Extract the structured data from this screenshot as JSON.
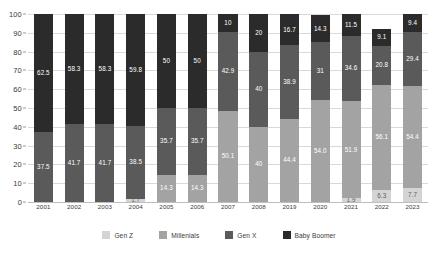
{
  "chart_data": {
    "type": "bar",
    "stacked": true,
    "title": "",
    "subtitle": "",
    "xlabel": "",
    "ylabel": "",
    "ylim": [
      0,
      100
    ],
    "yticks": [
      0,
      10,
      20,
      30,
      40,
      50,
      60,
      70,
      80,
      90,
      100
    ],
    "ytick_labels": [
      "0",
      "10",
      "20",
      "30",
      "40",
      "50",
      "60",
      "70",
      "80",
      "90",
      "100"
    ],
    "grid": true,
    "legend_position": "bottom",
    "categories": [
      "2001",
      "2002",
      "2003",
      "2004",
      "2005",
      "2006",
      "2007",
      "2008",
      "2019",
      "2020",
      "2021",
      "2022",
      "2023"
    ],
    "series": [
      {
        "name": "Gen Z",
        "color": "#d4d4d4",
        "values": [
          0,
          0,
          0,
          1.7,
          0,
          0,
          0,
          0,
          0,
          0,
          1.9,
          6.3,
          7.7
        ],
        "labels": [
          "",
          "",
          "",
          "1.7",
          "",
          "",
          "",
          "",
          "",
          "",
          "1.9",
          "6.3",
          "7.7"
        ]
      },
      {
        "name": "Millenials",
        "color": "#a3a3a3",
        "values": [
          0,
          0,
          0,
          0,
          14.3,
          14.3,
          50.1,
          40,
          44.4,
          54.0,
          51.9,
          56.1,
          54.4
        ],
        "labels": [
          "",
          "",
          "",
          "",
          "14.3",
          "14.3",
          "50.1",
          "40",
          "44.4",
          "54.0",
          "51.9",
          "56.1",
          "54.4"
        ]
      },
      {
        "name": "Gen X",
        "color": "#5a5a5a",
        "values": [
          37.5,
          41.7,
          41.7,
          38.5,
          35.7,
          35.7,
          42.9,
          40,
          38.9,
          31,
          34.6,
          20.8,
          29.4
        ],
        "labels": [
          "37.5",
          "41.7",
          "41.7",
          "38.5",
          "35.7",
          "35.7",
          "42.9",
          "40",
          "38.9",
          "31",
          "34.6",
          "20.8",
          "29.4"
        ]
      },
      {
        "name": "Baby Boomer",
        "color": "#2b2b2b",
        "values": [
          62.5,
          58.3,
          58.3,
          59.8,
          50,
          50,
          10,
          20,
          16.7,
          14.3,
          11.5,
          9.1,
          9.4
        ],
        "labels": [
          "62.5",
          "58.3",
          "58.3",
          "59.8",
          "50",
          "50",
          "10",
          "20",
          "16.7",
          "14.3",
          "11.5",
          "9.1",
          "9.4"
        ]
      }
    ]
  },
  "legend": {
    "items": [
      {
        "label": "Gen Z",
        "color": "#d4d4d4"
      },
      {
        "label": "Millenials",
        "color": "#a3a3a3"
      },
      {
        "label": "Gen X",
        "color": "#5a5a5a"
      },
      {
        "label": "Baby Boomer",
        "color": "#2b2b2b"
      }
    ]
  },
  "colors": {
    "gen_z": "#d4d4d4",
    "millenials": "#a3a3a3",
    "gen_x": "#5a5a5a",
    "baby_boomer": "#2b2b2b",
    "grid": "#d9d9d9",
    "background": "#ffffff",
    "axis_text": "#3a3a3a"
  }
}
